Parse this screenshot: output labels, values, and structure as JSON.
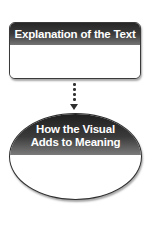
{
  "diagram": {
    "box": {
      "title": "Explanation of the Text",
      "body": ""
    },
    "ellipse": {
      "title_line1": "How the Visual",
      "title_line2": "Adds to Meaning",
      "body": ""
    },
    "connector": {
      "style": "dotted",
      "direction": "down"
    },
    "colors": {
      "header_dark": "#262626",
      "header_light": "#747474",
      "border": "#3a3a3a",
      "background": "#ffffff",
      "header_text": "#ffffff"
    }
  }
}
